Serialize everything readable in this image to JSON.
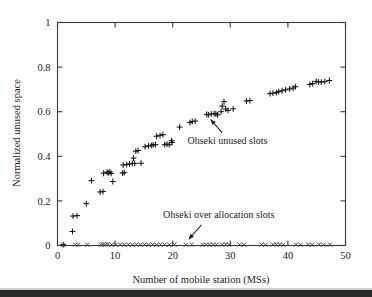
{
  "chart_data": {
    "type": "scatter",
    "title": "",
    "xlabel": "Number of mobile station (MSs)",
    "ylabel": "Normalized unused space",
    "xlim": [
      0,
      50
    ],
    "ylim": [
      0,
      1
    ],
    "xticks": [
      0,
      10,
      20,
      30,
      40,
      50
    ],
    "yticks": [
      0,
      0.2,
      0.4,
      0.6,
      0.8,
      1
    ],
    "xtick_labels": [
      "0",
      "10",
      "20",
      "30",
      "40",
      "50"
    ],
    "ytick_labels": [
      "0",
      "0.2",
      "0.4",
      "0.6",
      "0.8",
      "1"
    ],
    "grid": false,
    "legend_position": "none",
    "annotations": [
      {
        "text": "Ohseki unused slots",
        "text_x": 29.5,
        "text_y": 0.455,
        "arrow_from_x": 28.6,
        "arrow_from_y": 0.505,
        "arrow_to_x": 26.6,
        "arrow_to_y": 0.565
      },
      {
        "text": "Ohseki over allocation slots",
        "text_x": 28.0,
        "text_y": 0.123,
        "arrow_from_x": 25.0,
        "arrow_from_y": 0.093,
        "arrow_to_x": 22.8,
        "arrow_to_y": 0.028
      }
    ],
    "series": [
      {
        "name": "Ohseki unused slots",
        "marker": "plus",
        "color": "#141414",
        "points": [
          [
            1.0,
            0.004
          ],
          [
            2.6,
            0.063
          ],
          [
            2.7,
            0.132
          ],
          [
            3.4,
            0.134
          ],
          [
            5.0,
            0.188
          ],
          [
            5.9,
            0.291
          ],
          [
            7.4,
            0.24
          ],
          [
            7.9,
            0.242
          ],
          [
            8.0,
            0.324
          ],
          [
            8.6,
            0.329
          ],
          [
            8.8,
            0.326
          ],
          [
            9.1,
            0.33
          ],
          [
            9.3,
            0.323
          ],
          [
            9.6,
            0.287
          ],
          [
            11.3,
            0.325
          ],
          [
            11.6,
            0.327
          ],
          [
            11.4,
            0.361
          ],
          [
            12.0,
            0.363
          ],
          [
            12.5,
            0.366
          ],
          [
            13.0,
            0.368
          ],
          [
            13.2,
            0.392
          ],
          [
            13.4,
            0.368
          ],
          [
            13.6,
            0.423
          ],
          [
            14.0,
            0.426
          ],
          [
            14.5,
            0.369
          ],
          [
            15.2,
            0.443
          ],
          [
            15.8,
            0.447
          ],
          [
            16.3,
            0.449
          ],
          [
            16.6,
            0.451
          ],
          [
            17.0,
            0.452
          ],
          [
            17.2,
            0.49
          ],
          [
            17.8,
            0.494
          ],
          [
            18.3,
            0.497
          ],
          [
            18.6,
            0.452
          ],
          [
            19.0,
            0.455
          ],
          [
            19.4,
            0.452
          ],
          [
            19.8,
            0.47
          ],
          [
            19.9,
            0.462
          ],
          [
            21.2,
            0.531
          ],
          [
            23.0,
            0.551
          ],
          [
            23.4,
            0.556
          ],
          [
            23.9,
            0.558
          ],
          [
            25.9,
            0.588
          ],
          [
            26.2,
            0.586
          ],
          [
            26.7,
            0.59
          ],
          [
            27.2,
            0.592
          ],
          [
            27.5,
            0.59
          ],
          [
            27.8,
            0.586
          ],
          [
            28.4,
            0.6
          ],
          [
            28.6,
            0.625
          ],
          [
            28.9,
            0.645
          ],
          [
            29.2,
            0.612
          ],
          [
            29.6,
            0.606
          ],
          [
            30.5,
            0.613
          ],
          [
            32.8,
            0.648
          ],
          [
            33.4,
            0.65
          ],
          [
            36.9,
            0.681
          ],
          [
            37.4,
            0.683
          ],
          [
            38.0,
            0.686
          ],
          [
            38.4,
            0.69
          ],
          [
            39.0,
            0.694
          ],
          [
            39.6,
            0.698
          ],
          [
            40.3,
            0.702
          ],
          [
            40.9,
            0.706
          ],
          [
            41.3,
            0.712
          ],
          [
            43.8,
            0.722
          ],
          [
            44.3,
            0.726
          ],
          [
            44.9,
            0.736
          ],
          [
            45.3,
            0.734
          ],
          [
            45.8,
            0.733
          ],
          [
            46.4,
            0.735
          ],
          [
            47.2,
            0.74
          ]
        ]
      },
      {
        "name": "Ohseki over allocation slots",
        "marker": "cross",
        "color": "#3c3c3c",
        "points": [
          [
            1.0,
            0.002
          ],
          [
            3.1,
            0.004
          ],
          [
            3.6,
            0.003
          ],
          [
            5.2,
            0.003
          ],
          [
            7.5,
            0.004
          ],
          [
            7.9,
            0.005
          ],
          [
            8.3,
            0.004
          ],
          [
            8.7,
            0.006
          ],
          [
            9.4,
            0.003
          ],
          [
            10.1,
            0.003
          ],
          [
            10.9,
            0.004
          ],
          [
            11.6,
            0.003
          ],
          [
            12.3,
            0.004
          ],
          [
            13.0,
            0.003
          ],
          [
            13.7,
            0.004
          ],
          [
            14.4,
            0.003
          ],
          [
            15.1,
            0.004
          ],
          [
            15.8,
            0.003
          ],
          [
            16.5,
            0.004
          ],
          [
            17.2,
            0.003
          ],
          [
            17.9,
            0.004
          ],
          [
            18.6,
            0.004
          ],
          [
            19.4,
            0.003
          ],
          [
            20.3,
            0.004
          ],
          [
            22.3,
            0.003
          ],
          [
            23.3,
            0.004
          ],
          [
            25.2,
            0.003
          ],
          [
            25.8,
            0.004
          ],
          [
            26.4,
            0.003
          ],
          [
            27.0,
            0.004
          ],
          [
            27.6,
            0.003
          ],
          [
            28.6,
            0.004
          ],
          [
            29.2,
            0.005
          ],
          [
            29.8,
            0.003
          ],
          [
            31.6,
            0.004
          ],
          [
            32.4,
            0.003
          ],
          [
            35.4,
            0.004
          ],
          [
            36.1,
            0.003
          ],
          [
            37.4,
            0.004
          ],
          [
            38.0,
            0.005
          ],
          [
            38.6,
            0.004
          ],
          [
            39.2,
            0.003
          ],
          [
            41.4,
            0.004
          ],
          [
            42.2,
            0.003
          ],
          [
            43.5,
            0.004
          ],
          [
            44.2,
            0.003
          ],
          [
            45.4,
            0.004
          ],
          [
            46.2,
            0.003
          ],
          [
            47.3,
            0.004
          ]
        ]
      }
    ]
  }
}
